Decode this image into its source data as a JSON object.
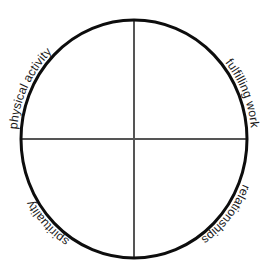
{
  "figure": {
    "name": "life-balance-circle",
    "background_color": "#ffffff",
    "outline_color": "#0d0d0d",
    "crosshair_color": "#555555",
    "label_color": "#1a1a1a"
  },
  "circle": {
    "center_x": 134,
    "center_y": 139,
    "radius_x": 113,
    "radius_y": 119,
    "stroke_width": 3
  },
  "crosshair": {
    "vertical_label": "vertical-axis",
    "horizontal_label": "horizontal-axis",
    "stroke_width": 2
  },
  "quadrants": [
    {
      "id": "upper-left",
      "label": "physical activity",
      "orientation": "upright-arc"
    },
    {
      "id": "upper-right",
      "label": "fulfilling work",
      "orientation": "upright-arc"
    },
    {
      "id": "lower-left",
      "label": "spirituality",
      "orientation": "inverted-arc"
    },
    {
      "id": "lower-right",
      "label": "relationships",
      "orientation": "inverted-arc"
    }
  ]
}
